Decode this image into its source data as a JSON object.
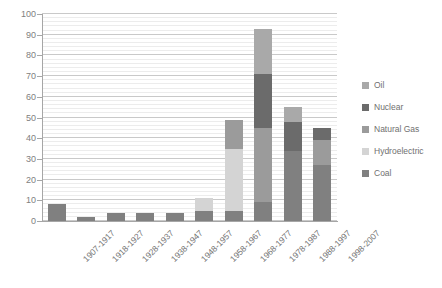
{
  "chart_data": {
    "type": "bar",
    "subtype": "stacked-column",
    "title": "",
    "xlabel": "",
    "ylabel": "",
    "ylim": [
      0,
      100
    ],
    "ytick_step": 10,
    "yticks": [
      0,
      10,
      20,
      30,
      40,
      50,
      60,
      70,
      80,
      90,
      100
    ],
    "ytick_labels": [
      "0",
      "10",
      "20",
      "30",
      "40",
      "50",
      "60",
      "70",
      "80",
      "90",
      "100"
    ],
    "grid": true,
    "minor_grid": true,
    "legend_position": "right",
    "categories": [
      "1907-1917",
      "1918-1927",
      "1928-1937",
      "1938-1947",
      "1948-1957",
      "1958-1967",
      "1968-1977",
      "1978-1987",
      "1988-1997",
      "1998-2007"
    ],
    "series": [
      {
        "name": "Coal",
        "color": "#808080",
        "values": [
          8,
          2,
          4,
          4,
          4,
          5,
          5,
          9,
          34,
          27
        ]
      },
      {
        "name": "Hydroelectric",
        "color": "#d4d4d4",
        "values": [
          0,
          0,
          0,
          0,
          0,
          6,
          30,
          0,
          0,
          0
        ]
      },
      {
        "name": "Natural Gas",
        "color": "#9b9b9b",
        "values": [
          0,
          0,
          0,
          0,
          0,
          0,
          14,
          36,
          0,
          12
        ]
      },
      {
        "name": "Nuclear",
        "color": "#6b6b6b",
        "values": [
          0,
          0,
          0,
          0,
          0,
          0,
          0,
          26,
          14,
          6
        ]
      },
      {
        "name": "Oil",
        "color": "#a9a9a9",
        "values": [
          0,
          0,
          0,
          0,
          0,
          0,
          0,
          22,
          7,
          0
        ]
      }
    ],
    "totals": [
      8,
      2,
      4,
      4,
      4,
      11,
      49,
      93,
      55,
      45
    ],
    "legend_entries": [
      {
        "label": "Oil",
        "color": "#a9a9a9"
      },
      {
        "label": "Nuclear",
        "color": "#6b6b6b"
      },
      {
        "label": "Natural Gas",
        "color": "#9b9b9b"
      },
      {
        "label": "Hydroelectric",
        "color": "#d4d4d4"
      },
      {
        "label": "Coal",
        "color": "#808080"
      }
    ],
    "stack_order_bottom_to_top": [
      "Coal",
      "Hydroelectric",
      "Natural Gas",
      "Nuclear",
      "Oil"
    ]
  },
  "axis": {
    "y_tick_color": "#808080",
    "x_tick_color": "#737373",
    "line_color": "#a6a6a6",
    "grid_major_color": "#c9c9c9",
    "grid_minor_color": "#ececec"
  }
}
